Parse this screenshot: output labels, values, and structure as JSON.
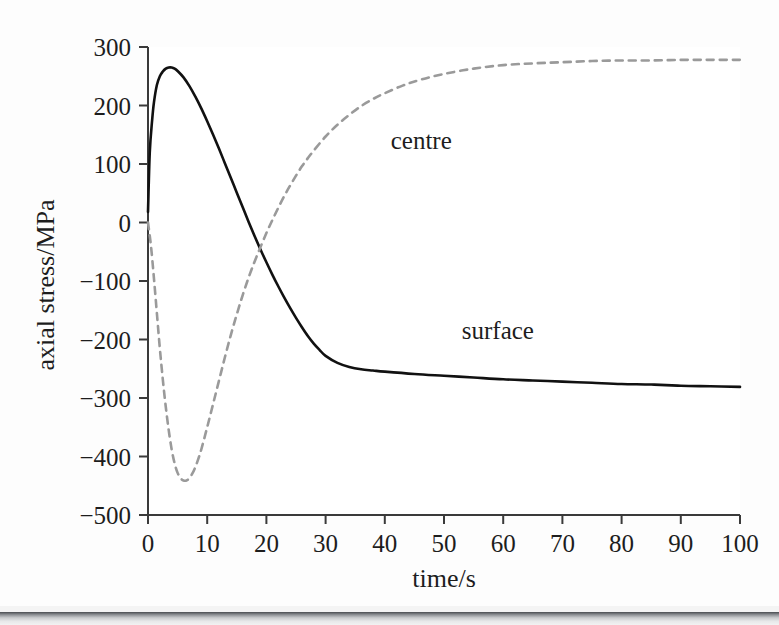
{
  "figure": {
    "background_color": "#fdfdfd",
    "ink_color": "#1d1d1d",
    "dashed_color": "#9a9a9a"
  },
  "chart_data": {
    "type": "line",
    "title": "",
    "subtitle": "",
    "xlabel": "time/s",
    "ylabel": "axial stress/MPa",
    "xlim": [
      0,
      100
    ],
    "ylim": [
      -500,
      300
    ],
    "grid": false,
    "legend_position": "inline-annotations",
    "x_ticks": [
      0,
      10,
      20,
      30,
      40,
      50,
      60,
      70,
      80,
      90,
      100
    ],
    "x_tick_labels": [
      "0",
      "10",
      "20",
      "30",
      "40",
      "50",
      "60",
      "70",
      "80",
      "90",
      "100"
    ],
    "y_ticks": [
      -500,
      -400,
      -300,
      -200,
      -100,
      0,
      100,
      200,
      300
    ],
    "y_tick_labels": [
      "−500",
      "−400",
      "−300",
      "−200",
      "−100",
      "0",
      "100",
      "200",
      "300"
    ],
    "annotations": [
      {
        "text": "centre",
        "x": 41,
        "y": 140
      },
      {
        "text": "surface",
        "x": 53,
        "y": -185
      }
    ],
    "series": [
      {
        "name": "surface",
        "style": "solid",
        "color": "#111111",
        "x": [
          0,
          0.3,
          0.7,
          1,
          1.5,
          2,
          2.5,
          3,
          3.5,
          4,
          4.5,
          5,
          6,
          7,
          8,
          9,
          10,
          11,
          12,
          13,
          14,
          15,
          16,
          17,
          18,
          19,
          20,
          21,
          22,
          23,
          24,
          25,
          26,
          27,
          28,
          29,
          30,
          32,
          34,
          36,
          38,
          40,
          45,
          50,
          55,
          60,
          65,
          70,
          75,
          80,
          85,
          90,
          95,
          100
        ],
        "values": [
          18,
          120,
          175,
          205,
          235,
          250,
          258,
          263,
          265,
          265,
          263,
          259,
          248,
          233,
          215,
          195,
          173,
          150,
          126,
          101,
          76,
          51,
          26,
          1,
          -23,
          -46,
          -68,
          -89,
          -109,
          -128,
          -146,
          -163,
          -179,
          -194,
          -207,
          -218,
          -228,
          -240,
          -247,
          -251,
          -253,
          -255,
          -259,
          -262,
          -265,
          -268,
          -270,
          -272,
          -274,
          -276,
          -277,
          -279,
          -280,
          -281
        ]
      },
      {
        "name": "centre",
        "style": "dashed",
        "color": "#9a9a9a",
        "x": [
          0,
          0.5,
          1,
          1.5,
          2,
          2.5,
          3,
          3.5,
          4,
          4.5,
          5,
          5.5,
          6,
          6.5,
          7,
          7.5,
          8,
          8.5,
          9,
          10,
          11,
          12,
          13,
          14,
          15,
          16,
          17,
          18,
          19,
          20,
          21,
          22,
          23,
          24,
          25,
          26,
          27,
          28,
          30,
          32,
          34,
          36,
          38,
          40,
          43,
          46,
          50,
          55,
          60,
          65,
          70,
          75,
          80,
          85,
          90,
          95,
          100
        ],
        "values": [
          0,
          -40,
          -95,
          -155,
          -215,
          -268,
          -315,
          -355,
          -388,
          -412,
          -428,
          -437,
          -441,
          -441,
          -437,
          -429,
          -418,
          -404,
          -388,
          -350,
          -310,
          -270,
          -230,
          -192,
          -157,
          -124,
          -94,
          -67,
          -42,
          -18,
          4,
          25,
          45,
          63,
          80,
          96,
          110,
          123,
          147,
          167,
          184,
          199,
          211,
          221,
          234,
          244,
          254,
          263,
          269,
          272,
          274,
          276,
          277,
          277,
          278,
          278,
          278
        ]
      }
    ]
  },
  "axis_geometry": {
    "left_px": 148,
    "right_px": 740,
    "top_px": 47,
    "bottom_px": 515,
    "tick_length_px": 9
  }
}
